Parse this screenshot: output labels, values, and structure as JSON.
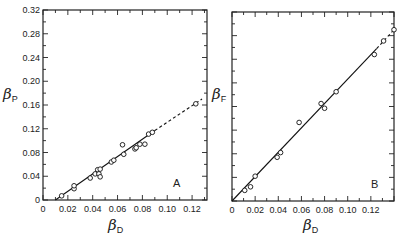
{
  "chart_data": [
    {
      "type": "scatter",
      "panel": "A",
      "title": "",
      "xlabel": "βD",
      "ylabel": "βP",
      "xlabel_symbol": "β",
      "xlabel_sub": "D",
      "ylabel_symbol": "β",
      "ylabel_sub": "P",
      "xlim": [
        0,
        0.132
      ],
      "ylim": [
        0,
        0.32
      ],
      "x_ticks": [
        "0",
        "0.02",
        "0.04",
        "0.06",
        "0.08",
        "0.10",
        "0.12"
      ],
      "y_ticks": [
        "0",
        "0.04",
        "0.08",
        "0.12",
        "0.16",
        "0.20",
        "0.24",
        "0.28",
        "0.32"
      ],
      "grid": false,
      "legend": null,
      "points": [
        {
          "x": 0.015,
          "y": 0.007
        },
        {
          "x": 0.025,
          "y": 0.019
        },
        {
          "x": 0.025,
          "y": 0.024
        },
        {
          "x": 0.038,
          "y": 0.037
        },
        {
          "x": 0.042,
          "y": 0.044
        },
        {
          "x": 0.044,
          "y": 0.051
        },
        {
          "x": 0.045,
          "y": 0.044
        },
        {
          "x": 0.046,
          "y": 0.039
        },
        {
          "x": 0.046,
          "y": 0.052
        },
        {
          "x": 0.055,
          "y": 0.064
        },
        {
          "x": 0.057,
          "y": 0.067
        },
        {
          "x": 0.064,
          "y": 0.093
        },
        {
          "x": 0.065,
          "y": 0.077
        },
        {
          "x": 0.074,
          "y": 0.086
        },
        {
          "x": 0.075,
          "y": 0.088
        },
        {
          "x": 0.078,
          "y": 0.094
        },
        {
          "x": 0.082,
          "y": 0.094
        },
        {
          "x": 0.085,
          "y": 0.111
        },
        {
          "x": 0.088,
          "y": 0.114
        },
        {
          "x": 0.123,
          "y": 0.162
        }
      ],
      "fit_line": {
        "solid": {
          "x": [
            0.01,
            0.09
          ],
          "y": [
            0.0,
            0.117
          ]
        },
        "dashed": {
          "x": [
            0.09,
            0.128
          ],
          "y": [
            0.117,
            0.17
          ]
        }
      }
    },
    {
      "type": "scatter",
      "panel": "B",
      "title": "",
      "xlabel": "βD",
      "ylabel": "βF",
      "xlabel_symbol": "β",
      "xlabel_sub": "D",
      "ylabel_symbol": "β",
      "ylabel_sub": "F",
      "xlim": [
        0,
        0.14
      ],
      "ylim": [
        0,
        0.32
      ],
      "x_ticks": [
        "0",
        "0.02",
        "0.04",
        "0.06",
        "0.08",
        "0.10",
        "0.12"
      ],
      "y_ticks": [],
      "grid": false,
      "legend": null,
      "points": [
        {
          "x": 0.011,
          "y": 0.018
        },
        {
          "x": 0.016,
          "y": 0.024
        },
        {
          "x": 0.02,
          "y": 0.042
        },
        {
          "x": 0.039,
          "y": 0.074
        },
        {
          "x": 0.042,
          "y": 0.082
        },
        {
          "x": 0.058,
          "y": 0.133
        },
        {
          "x": 0.077,
          "y": 0.165
        },
        {
          "x": 0.08,
          "y": 0.157
        },
        {
          "x": 0.09,
          "y": 0.185
        },
        {
          "x": 0.123,
          "y": 0.248
        },
        {
          "x": 0.131,
          "y": 0.271
        },
        {
          "x": 0.14,
          "y": 0.29
        }
      ],
      "fit_line": {
        "solid": {
          "x": [
            0.0,
            0.125
          ],
          "y": [
            0.0,
            0.258
          ]
        },
        "dashed": {
          "x": [
            0.125,
            0.14
          ],
          "y": [
            0.258,
            0.29
          ]
        }
      }
    }
  ],
  "panels": {
    "A": {
      "letter": "A",
      "x_title": "β",
      "x_sub": "D",
      "y_title": "β",
      "y_sub": "P"
    },
    "B": {
      "letter": "B",
      "x_title": "β",
      "x_sub": "D",
      "y_title": "β",
      "y_sub": "F"
    }
  }
}
